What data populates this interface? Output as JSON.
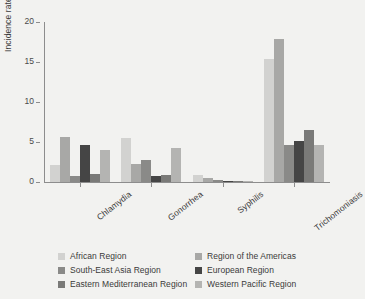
{
  "chart_data": {
    "type": "bar",
    "title": "",
    "xlabel": "",
    "ylabel": "Incidence rate, %",
    "ylim": [
      0,
      20
    ],
    "yticks": [
      0,
      5,
      10,
      15,
      20
    ],
    "grid": false,
    "legend_position": "bottom",
    "categories": [
      "Chlamydia",
      "Gonorrhea",
      "Syphilis",
      "Trichomoniasis"
    ],
    "series": [
      {
        "name": "African Region",
        "color": "#d2d2d0",
        "values": [
          2.1,
          5.5,
          0.9,
          15.4
        ]
      },
      {
        "name": "Region of the Americas",
        "color": "#a8a8a6",
        "values": [
          5.6,
          2.2,
          0.55,
          17.9
        ]
      },
      {
        "name": "South-East Asia Region",
        "color": "#8a8a88",
        "values": [
          0.7,
          2.7,
          0.3,
          4.6
        ]
      },
      {
        "name": "European Region",
        "color": "#454545",
        "values": [
          4.6,
          0.8,
          0.1,
          5.1
        ]
      },
      {
        "name": "Eastern Mediterranean Region",
        "color": "#7a7a78",
        "values": [
          1.0,
          0.9,
          0.1,
          6.5
        ]
      },
      {
        "name": "Western Pacific Region",
        "color": "#b4b4b2",
        "values": [
          4.0,
          4.3,
          0.15,
          4.6
        ]
      }
    ]
  },
  "axis": {
    "y_label": "Incidence rate, %",
    "y_tick_labels": [
      "0",
      "5",
      "10",
      "15",
      "20"
    ],
    "x_tick_labels": [
      "Chlamydia",
      "Gonorrhea",
      "Syphilis",
      "Trichomoniasis"
    ]
  },
  "legend": {
    "entries": [
      {
        "label": "African Region",
        "color": "#d2d2d0"
      },
      {
        "label": "Region of the Americas",
        "color": "#a8a8a6"
      },
      {
        "label": "South-East Asia Region",
        "color": "#8a8a88"
      },
      {
        "label": "European Region",
        "color": "#454545"
      },
      {
        "label": "Eastern Mediterranean Region",
        "color": "#7a7a78"
      },
      {
        "label": "Western Pacific Region",
        "color": "#b4b4b2"
      }
    ]
  },
  "colors": {
    "background": "#f2f2f0",
    "axis": "#8d8d8d",
    "text": "#3a3a3a"
  }
}
